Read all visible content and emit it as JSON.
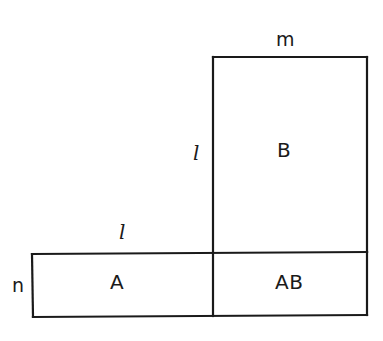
{
  "figure": {
    "type": "geometric-diagram",
    "background_color": "#ffffff",
    "stroke_color": "#1a1a1a",
    "stroke_width_px": 2,
    "canvas": {
      "width": 383,
      "height": 341
    },
    "regions": [
      {
        "id": "B",
        "label": "B",
        "shape": "rectangle",
        "x": 213,
        "y": 57,
        "width": 154,
        "height": 196
      },
      {
        "id": "A",
        "label": "A",
        "shape": "rectangle",
        "x": 32,
        "y": 253,
        "width": 181,
        "height": 64
      },
      {
        "id": "AB",
        "label": "AB",
        "shape": "rectangle",
        "x": 213,
        "y": 253,
        "width": 154,
        "height": 64
      }
    ],
    "dimension_labels": [
      {
        "id": "m",
        "text": "m",
        "edge": "top-of-B",
        "x": 276,
        "y": 30
      },
      {
        "id": "l-vert",
        "text": "l",
        "edge": "left-of-B",
        "x": 193,
        "y": 143
      },
      {
        "id": "l-horiz",
        "text": "l",
        "edge": "top-of-A",
        "x": 119,
        "y": 222
      },
      {
        "id": "n",
        "text": "n",
        "edge": "left-of-bottom-bar",
        "x": 12,
        "y": 276
      }
    ],
    "region_labels": [
      {
        "id": "B",
        "text": "B",
        "x": 277,
        "y": 140
      },
      {
        "id": "A",
        "text": "A",
        "x": 110,
        "y": 272
      },
      {
        "id": "AB",
        "text": "AB",
        "x": 275,
        "y": 272
      }
    ],
    "paths": {
      "outline": "M 32 254 L 213 253 L 213 57 L 367 57 L 367 252 L 367 315 L 33 317 Z",
      "top_of_B": "M 213 57 L 367 57",
      "right_of_B": "M 367 57 L 367 252",
      "left_of_B": "M 213 57 L 213 253",
      "horizontal_divider": "M 32 254 L 367 252",
      "vertical_divider": "M 213 253 L 213 316",
      "bottom_edge": "M 33 317 L 367 315",
      "left_edge_of_A": "M 32 254 L 33 317",
      "right_edge_of_AB": "M 367 252 L 367 315"
    }
  }
}
